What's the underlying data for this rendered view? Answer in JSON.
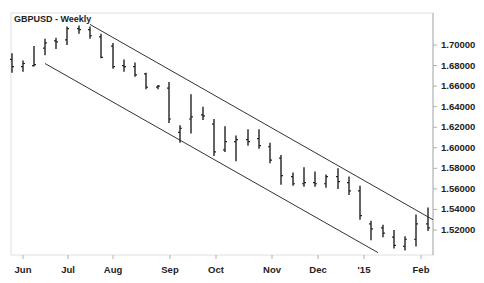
{
  "chart_data": {
    "type": "ohlc",
    "title": "GBPUSD - Weekly",
    "xlabel": "",
    "ylabel": "",
    "ylim": [
      1.497,
      1.7245
    ],
    "grid": false,
    "y_ticks": [
      "1.70000",
      "1.68000",
      "1.66000",
      "1.64000",
      "1.62000",
      "1.60000",
      "1.58000",
      "1.56000",
      "1.54000",
      "1.52000"
    ],
    "x_ticks": [
      {
        "label": "Jun",
        "x": 23
      },
      {
        "label": "Jul",
        "x": 68
      },
      {
        "label": "Aug",
        "x": 113
      },
      {
        "label": "Sep",
        "x": 170
      },
      {
        "label": "Oct",
        "x": 216
      },
      {
        "label": "Nov",
        "x": 272
      },
      {
        "label": "Dec",
        "x": 318
      },
      {
        "label": "'15",
        "x": 364
      },
      {
        "label": "Feb",
        "x": 421
      }
    ],
    "bars": [
      {
        "x": 12,
        "open": 1.686,
        "high": 1.692,
        "low": 1.673,
        "close": 1.679
      },
      {
        "x": 23,
        "open": 1.679,
        "high": 1.685,
        "low": 1.674,
        "close": 1.682
      },
      {
        "x": 34,
        "open": 1.68,
        "high": 1.699,
        "low": 1.679,
        "close": 1.681
      },
      {
        "x": 45,
        "open": 1.697,
        "high": 1.706,
        "low": 1.69,
        "close": 1.702
      },
      {
        "x": 56,
        "open": 1.704,
        "high": 1.707,
        "low": 1.696,
        "close": 1.703
      },
      {
        "x": 67,
        "open": 1.705,
        "high": 1.718,
        "low": 1.7,
        "close": 1.716
      },
      {
        "x": 79,
        "open": 1.716,
        "high": 1.719,
        "low": 1.711,
        "close": 1.715
      },
      {
        "x": 90,
        "open": 1.715,
        "high": 1.718,
        "low": 1.706,
        "close": 1.709
      },
      {
        "x": 101,
        "open": 1.708,
        "high": 1.711,
        "low": 1.687,
        "close": 1.688
      },
      {
        "x": 113,
        "open": 1.699,
        "high": 1.702,
        "low": 1.677,
        "close": 1.679
      },
      {
        "x": 124,
        "open": 1.68,
        "high": 1.686,
        "low": 1.674,
        "close": 1.679
      },
      {
        "x": 135,
        "open": 1.679,
        "high": 1.683,
        "low": 1.669,
        "close": 1.671
      },
      {
        "x": 146,
        "open": 1.672,
        "high": 1.673,
        "low": 1.657,
        "close": 1.659
      },
      {
        "x": 158,
        "open": 1.659,
        "high": 1.661,
        "low": 1.657,
        "close": 1.66
      },
      {
        "x": 169,
        "open": 1.658,
        "high": 1.664,
        "low": 1.624,
        "close": 1.628
      },
      {
        "x": 180,
        "open": 1.615,
        "high": 1.622,
        "low": 1.605,
        "close": 1.619
      },
      {
        "x": 191,
        "open": 1.628,
        "high": 1.652,
        "low": 1.614,
        "close": 1.63
      },
      {
        "x": 203,
        "open": 1.632,
        "high": 1.64,
        "low": 1.627,
        "close": 1.631
      },
      {
        "x": 214,
        "open": 1.623,
        "high": 1.628,
        "low": 1.592,
        "close": 1.596
      },
      {
        "x": 225,
        "open": 1.598,
        "high": 1.621,
        "low": 1.596,
        "close": 1.606
      },
      {
        "x": 236,
        "open": 1.606,
        "high": 1.612,
        "low": 1.587,
        "close": 1.608
      },
      {
        "x": 248,
        "open": 1.608,
        "high": 1.618,
        "low": 1.602,
        "close": 1.606
      },
      {
        "x": 259,
        "open": 1.609,
        "high": 1.618,
        "low": 1.599,
        "close": 1.602
      },
      {
        "x": 270,
        "open": 1.601,
        "high": 1.605,
        "low": 1.585,
        "close": 1.588
      },
      {
        "x": 281,
        "open": 1.59,
        "high": 1.593,
        "low": 1.564,
        "close": 1.573
      },
      {
        "x": 293,
        "open": 1.572,
        "high": 1.576,
        "low": 1.563,
        "close": 1.565
      },
      {
        "x": 304,
        "open": 1.565,
        "high": 1.581,
        "low": 1.562,
        "close": 1.566
      },
      {
        "x": 315,
        "open": 1.566,
        "high": 1.577,
        "low": 1.562,
        "close": 1.565
      },
      {
        "x": 326,
        "open": 1.565,
        "high": 1.574,
        "low": 1.561,
        "close": 1.572
      },
      {
        "x": 338,
        "open": 1.572,
        "high": 1.58,
        "low": 1.56,
        "close": 1.567
      },
      {
        "x": 349,
        "open": 1.566,
        "high": 1.572,
        "low": 1.554,
        "close": 1.558
      },
      {
        "x": 360,
        "open": 1.558,
        "high": 1.563,
        "low": 1.53,
        "close": 1.534
      },
      {
        "x": 371,
        "open": 1.526,
        "high": 1.529,
        "low": 1.51,
        "close": 1.521
      },
      {
        "x": 383,
        "open": 1.522,
        "high": 1.525,
        "low": 1.513,
        "close": 1.517
      },
      {
        "x": 394,
        "open": 1.513,
        "high": 1.52,
        "low": 1.502,
        "close": 1.505
      },
      {
        "x": 405,
        "open": 1.504,
        "high": 1.514,
        "low": 1.5,
        "close": 1.511
      },
      {
        "x": 416,
        "open": 1.511,
        "high": 1.535,
        "low": 1.504,
        "close": 1.526
      },
      {
        "x": 428,
        "open": 1.526,
        "high": 1.542,
        "low": 1.519,
        "close": 1.522
      }
    ],
    "trendlines": [
      {
        "name": "channel-upper",
        "x1": 90,
        "y1": 1.72,
        "x2": 433,
        "y2": 1.53
      },
      {
        "name": "channel-lower",
        "x1": 45,
        "y1": 1.682,
        "x2": 378,
        "y2": 1.498
      }
    ]
  }
}
